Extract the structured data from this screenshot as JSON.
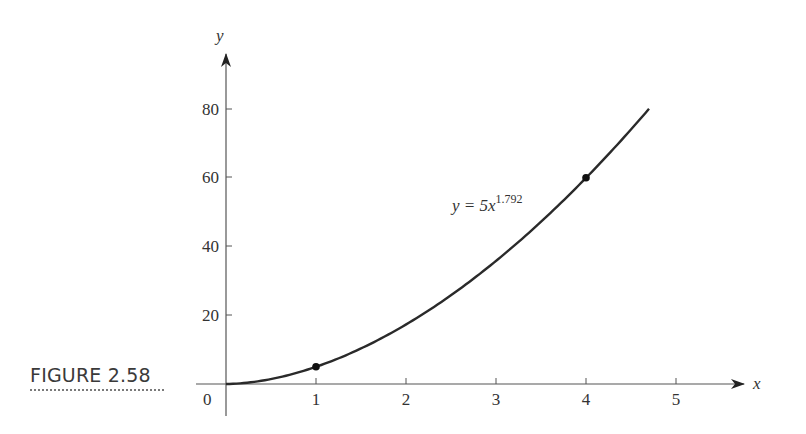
{
  "figure": {
    "label": "FIGURE 2.58"
  },
  "chart_data": {
    "type": "line",
    "title": "",
    "xlabel": "x",
    "ylabel": "y",
    "origin_label": "0",
    "x_ticks": [
      "1",
      "2",
      "3",
      "4",
      "5"
    ],
    "y_ticks": [
      "20",
      "40",
      "60",
      "80"
    ],
    "xlim": [
      0,
      5.5
    ],
    "ylim": [
      0,
      85
    ],
    "grid": false,
    "legend": null,
    "series": [
      {
        "name": "y = 5x^1.792",
        "function": "5*x^1.792",
        "x_range": [
          0,
          4.7
        ],
        "x": [
          0,
          0.5,
          1,
          1.5,
          2,
          2.5,
          3,
          3.5,
          4,
          4.5,
          4.7
        ],
        "y": [
          0,
          1.44,
          5,
          10.34,
          17.31,
          25.8,
          35.8,
          47.2,
          60.0,
          74.1,
          80.1
        ]
      }
    ],
    "marked_points": [
      {
        "x": 1,
        "y": 5
      },
      {
        "x": 4,
        "y": 60
      }
    ],
    "annotations": [
      {
        "text_base": "y = 5x",
        "text_exponent": "1.792",
        "x": 2.5,
        "y": 63
      }
    ]
  }
}
